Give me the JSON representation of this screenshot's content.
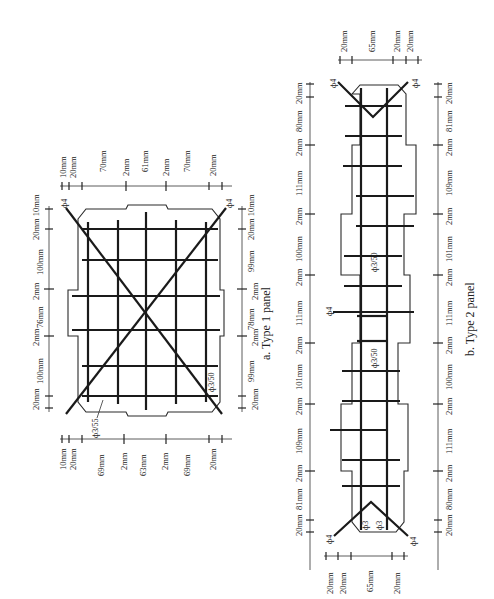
{
  "figure": {
    "orientation": "rotated 90 degrees counter-clockwise",
    "panels": [
      {
        "id": "type1",
        "caption": "a. Type 1 panel",
        "top_dimensions": [
          "10mm",
          "20mm",
          "70mm",
          "2mm",
          "61mm",
          "2mm",
          "70mm",
          "20mm"
        ],
        "bottom_dimensions": [
          "10mm",
          "20mm",
          "69mm",
          "2mm",
          "63mm",
          "2mm",
          "69mm",
          "20mm"
        ],
        "left_dimensions": [
          "20mm 10mm",
          "100mm",
          "2mm",
          "76mm",
          "2mm",
          "100mm",
          "20mm"
        ],
        "right_dimensions": [
          "20mm 10mm",
          "99mm",
          "2mm",
          "78mm",
          "2mm",
          "99mm",
          "20mm"
        ],
        "labels": {
          "diag_top_left": "ф4",
          "diag_top_right": "ф4",
          "mesh_left": "ф3/55",
          "mesh_right": "ф3/50"
        }
      },
      {
        "id": "type2",
        "caption": "b. Type 2 panel",
        "top_dimensions": [
          "20mm",
          "65mm",
          "20mm",
          "20mm"
        ],
        "bottom_dimensions": [
          "20mm",
          "20mm",
          "65mm",
          "20mm"
        ],
        "left_dimensions": [
          "20mm",
          "80mm",
          "2mm",
          "111mm",
          "2mm",
          "100mm",
          "2mm",
          "111mm",
          "2mm",
          "101mm",
          "2mm",
          "109mm",
          "2mm",
          "81mm",
          "20mm"
        ],
        "right_dimensions": [
          "20mm",
          "81mm",
          "2mm",
          "109mm",
          "2mm",
          "101mm",
          "2mm",
          "111mm",
          "2mm",
          "100mm",
          "2mm",
          "111mm",
          "2mm",
          "80mm",
          "20mm"
        ],
        "labels": {
          "diag_top_left": "ф4",
          "diag_top_right": "ф4",
          "diag_bottom_left": "ф4",
          "diag_bottom_right": "ф4",
          "center_bar": "ф4",
          "mesh_upper": "ф3/50",
          "mesh_lower": "ф3/50",
          "bottom_bar_1": "ф3",
          "bottom_bar_2": "ф3"
        }
      }
    ]
  }
}
